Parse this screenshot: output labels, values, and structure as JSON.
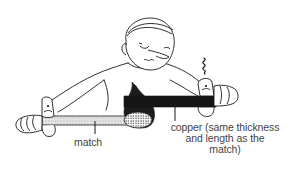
{
  "figure": {
    "labels": {
      "match": "match",
      "copper_line1": "copper (same thickness",
      "copper_line2": "and length as the",
      "copper_line3": "match)"
    },
    "colors": {
      "ink": "#1a1a1a",
      "text": "#444444",
      "copper_rod": "#151515",
      "match_stick": "#d4d4d4",
      "flame": "#1c1c1c",
      "background": "#ffffff"
    },
    "icons": {
      "heat_squiggle": "heat-wavy-lines",
      "flame": "flame"
    }
  }
}
